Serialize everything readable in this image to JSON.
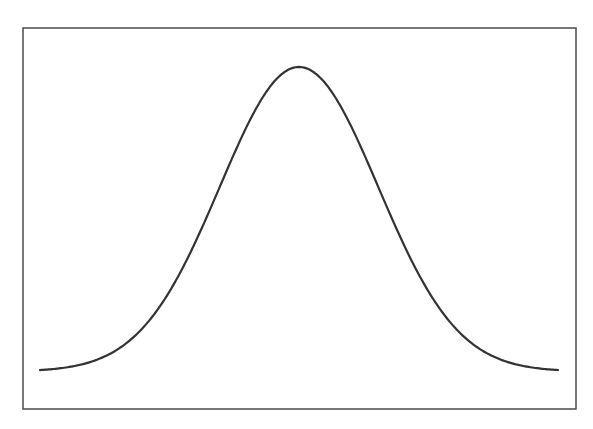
{
  "chart_data": {
    "type": "line",
    "title": "",
    "xlabel": "",
    "ylabel": "",
    "series": [
      {
        "name": "normal-pdf",
        "distribution": "normal",
        "mean": 0,
        "std": 1,
        "color": "#333333"
      }
    ],
    "xlim": [
      -3.27,
      3.27
    ],
    "ylim": [
      0,
      0.3989
    ],
    "grid": false,
    "legend": "none",
    "ticks_visible": false,
    "frame_color": "#555555"
  }
}
